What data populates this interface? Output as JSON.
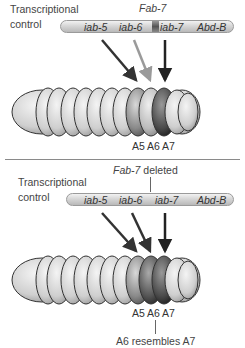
{
  "panels": [
    {
      "id": "wild-type",
      "annotation": "Transcriptional\ncontrol",
      "annotation_lines": [
        "Transcriptional",
        "control"
      ],
      "chromosome_labels": [
        "iab-5",
        "iab-6",
        "iab-7",
        "Abd-B"
      ],
      "fab_label": "Fab-7",
      "arrows": [
        {
          "from": "iab-5",
          "to": "A5",
          "color": "#3a3a3a"
        },
        {
          "from": "iab-6",
          "to": "A6",
          "color": "#9a9a9a"
        },
        {
          "from": "iab-7",
          "to": "A7",
          "color": "#2a2a2a"
        }
      ],
      "segment_labels": [
        "A5",
        "A6",
        "A7"
      ],
      "segment_shades": {
        "A5": "#8a8a8a",
        "A6": "#bcbcbc",
        "A7": "#4a4a4a"
      }
    },
    {
      "id": "fab7-deleted",
      "header": "Fab-7 deleted",
      "header_italic": "Fab-7",
      "header_rest": " deleted",
      "annotation_lines": [
        "Transcriptional",
        "control"
      ],
      "chromosome_labels": [
        "iab-5",
        "iab-6",
        "iab-7",
        "Abd-B"
      ],
      "arrows": [
        {
          "from": "iab-5",
          "to": "A5",
          "color": "#3a3a3a"
        },
        {
          "from": "iab-6",
          "to": "A6",
          "color": "#3a3a3a"
        },
        {
          "from": "iab-7",
          "to": "A7",
          "color": "#2a2a2a"
        }
      ],
      "segment_labels": [
        "A5",
        "A6",
        "A7"
      ],
      "segment_shades": {
        "A5": "#8a8a8a",
        "A6": "#555555",
        "A7": "#4a4a4a"
      },
      "footer": "A6 resembles A7"
    }
  ]
}
